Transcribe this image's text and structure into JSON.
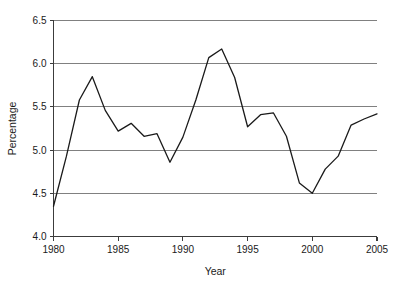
{
  "chart_data": {
    "type": "line",
    "title": "",
    "xlabel": "Year",
    "ylabel": "Percentage",
    "xlim": [
      1980,
      2005
    ],
    "ylim": [
      4.0,
      6.5
    ],
    "grid": "horizontal",
    "legend": "none",
    "x": [
      1980,
      1981,
      1982,
      1983,
      1984,
      1985,
      1986,
      1987,
      1988,
      1989,
      1990,
      1991,
      1992,
      1993,
      1994,
      1995,
      1996,
      1997,
      1998,
      1999,
      2000,
      2001,
      2002,
      2003,
      2004,
      2005
    ],
    "values": [
      4.35,
      4.93,
      5.58,
      5.85,
      5.46,
      5.22,
      5.31,
      5.16,
      5.19,
      4.86,
      5.15,
      5.58,
      6.07,
      6.17,
      5.84,
      5.27,
      5.41,
      5.43,
      5.16,
      4.62,
      4.5,
      4.78,
      4.93,
      5.29,
      5.36,
      5.42
    ],
    "series": [
      {
        "name": "Percentage",
        "color": "#1a1a1a",
        "values": [
          4.35,
          4.93,
          5.58,
          5.85,
          5.46,
          5.22,
          5.31,
          5.16,
          5.19,
          4.86,
          5.15,
          5.58,
          6.07,
          6.17,
          5.84,
          5.27,
          5.41,
          5.43,
          5.16,
          4.62,
          4.5,
          4.78,
          4.93,
          5.29,
          5.36,
          5.42
        ]
      }
    ],
    "y_ticks": [
      4.0,
      4.5,
      5.0,
      5.5,
      6.0,
      6.5
    ],
    "y_tick_labels": [
      "4.0",
      "4.5",
      "5.0",
      "5.5",
      "6.0",
      "6.5"
    ],
    "x_ticks": [
      1980,
      1985,
      1990,
      1995,
      2000,
      2005
    ],
    "x_tick_labels": [
      "1980",
      "1985",
      "1990",
      "1995",
      "2000",
      "2005"
    ],
    "gridline_color": "#808080",
    "axis_color": "#3c3c3c"
  }
}
